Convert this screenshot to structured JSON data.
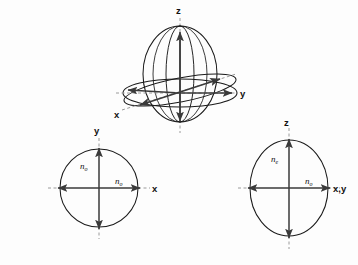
{
  "figure": {
    "title_visible": false,
    "background_color": "#fdfdfd",
    "stroke_color": "#1a1a1a",
    "dash_color": "#9a9a9a",
    "arrow_color": "#3a3a3a"
  },
  "indicatrix_3d": {
    "name": "optical-indicatrix-ellipsoid",
    "axis_labels": {
      "z": "z",
      "y": "y",
      "x": "x"
    },
    "shape": "prolate-ellipsoid",
    "has_equatorial_circle": true,
    "has_tilted_section": true,
    "meridian_count": 3
  },
  "section_circular": {
    "name": "circular-section-xy",
    "axis_labels": {
      "vertical": "y",
      "horizontal": "x"
    },
    "radius_labels": {
      "vertical": "n",
      "vertical_sub": "o",
      "horizontal": "n",
      "horizontal_sub": "o"
    },
    "shape": "circle"
  },
  "section_elliptical": {
    "name": "elliptical-section-z-xy",
    "axis_labels": {
      "vertical": "z",
      "horizontal": "x,y"
    },
    "radius_labels": {
      "vertical": "n",
      "vertical_sub": "e",
      "horizontal": "n",
      "horizontal_sub": "o"
    },
    "shape": "ellipse"
  }
}
